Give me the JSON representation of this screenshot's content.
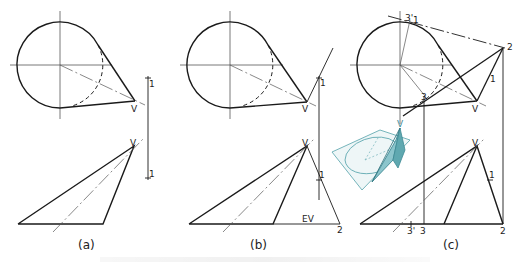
{
  "figure": {
    "panels": [
      {
        "id": "a",
        "caption": "(a)",
        "labels": {
          "vertex_top": "V",
          "vertex_bottom": "V",
          "point1_top": "1",
          "point1_bottom": "1"
        }
      },
      {
        "id": "b",
        "caption": "(b)",
        "labels": {
          "vertex_top": "V",
          "vertex_bottom": "V",
          "point1_top": "1",
          "point1_bottom": "1",
          "true_length": "EV",
          "point2": "2"
        }
      },
      {
        "id": "c",
        "caption": "(c)",
        "labels": {
          "vertex_top": "V",
          "vertex_bottom": "V",
          "point3prime_top": "3'",
          "point1_top": "1",
          "point2_top": "2",
          "point1_mid": "1",
          "point3_top": "3",
          "point3prime_bottom": "3'",
          "point3_bottom": "3",
          "point2_bottom": "2",
          "point1_bottom": "1"
        }
      }
    ],
    "inset": {
      "description": "pictorial view of cone with tangent plane",
      "accent_color": "#5fa8b0",
      "fill_color": "#8cc5cc",
      "labels": {
        "vertex": "V"
      }
    },
    "colors": {
      "line": "#1a1a1a",
      "thin": "#555555",
      "background": "#ffffff"
    }
  }
}
